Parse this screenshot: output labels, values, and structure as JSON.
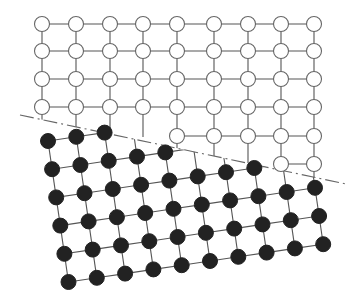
{
  "figure": {
    "title": "",
    "colors": {
      "line": "#555555",
      "open_fill": "#ffffff",
      "open_stroke": "#666666",
      "filled": "#222222",
      "boundary": "#666666"
    }
  },
  "boundary": {
    "style": "dash-dot",
    "start": [
      20,
      115
    ],
    "end": [
      346,
      184
    ]
  },
  "open_lattice": {
    "columns_x": [
      42,
      76,
      110,
      143,
      177,
      214,
      248,
      281,
      314
    ],
    "rows_y": [
      24,
      51,
      79,
      107,
      136,
      164
    ],
    "radius": 7.5,
    "visible_rows": [
      {
        "row": 0,
        "cols": [
          0,
          1,
          2,
          3,
          4,
          5,
          6,
          7,
          8
        ]
      },
      {
        "row": 1,
        "cols": [
          0,
          1,
          2,
          3,
          4,
          5,
          6,
          7,
          8
        ]
      },
      {
        "row": 2,
        "cols": [
          0,
          1,
          2,
          3,
          4,
          5,
          6,
          7,
          8
        ]
      },
      {
        "row": 3,
        "cols": [
          0,
          1,
          2,
          3,
          4,
          5,
          6,
          7,
          8
        ]
      },
      {
        "row": 4,
        "cols": [
          4,
          5,
          6,
          7,
          8
        ]
      },
      {
        "row": 5,
        "cols": [
          7,
          8
        ]
      }
    ]
  },
  "filled_lattice": {
    "origin": [
      48,
      141
    ],
    "col_vector": [
      28.3,
      -4.2
    ],
    "row_vector": [
      4.1,
      28.2
    ],
    "rows": 6,
    "columns": 10,
    "radius": 7.5,
    "clipped_by": "boundary (only nodes below the line are shown)"
  }
}
